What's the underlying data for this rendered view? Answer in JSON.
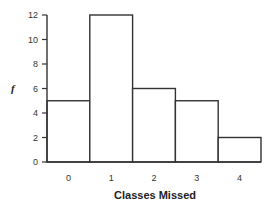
{
  "chart_data": {
    "type": "bar",
    "title": "",
    "xlabel": "Classes Missed",
    "ylabel": "f",
    "categories": [
      "0",
      "1",
      "2",
      "3",
      "4"
    ],
    "values": [
      5,
      12,
      6,
      5,
      2
    ],
    "yticks": [
      0,
      2,
      4,
      6,
      8,
      10,
      12
    ],
    "ylim": [
      0,
      12
    ],
    "grid": false,
    "legend": null,
    "style": "histogram, adjacent unfilled bars"
  }
}
